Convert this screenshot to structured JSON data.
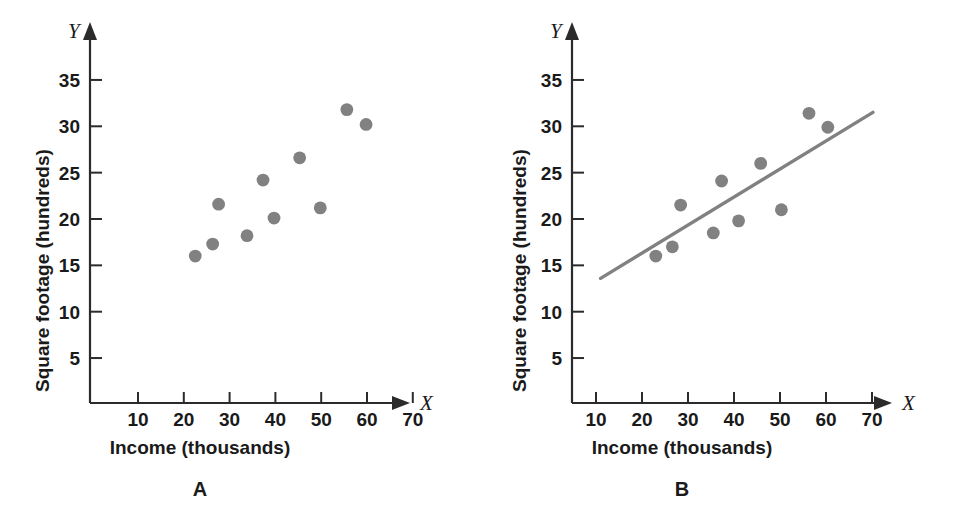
{
  "figure": {
    "panels": [
      {
        "letter": "A",
        "xlabel": "Income (thousands)",
        "ylabel": "Square footage (hundreds)",
        "x_var": "X",
        "y_var": "Y"
      },
      {
        "letter": "B",
        "xlabel": "Income (thousands)",
        "ylabel": "Square footage (hundreds)",
        "x_var": "X",
        "y_var": "Y"
      }
    ]
  },
  "colors": {
    "marker": "#818181",
    "fit_line": "#818181",
    "axis": "#2b2b2b",
    "background": "#ffffff"
  },
  "chart_data": [
    {
      "type": "scatter",
      "panel": "A",
      "title": "A",
      "xlabel": "Income (thousands)",
      "ylabel": "Square footage (hundreds)",
      "x_axis_variable": "X",
      "y_axis_variable": "Y",
      "xlim": [
        0,
        75
      ],
      "ylim": [
        0,
        38
      ],
      "xticks": [
        10,
        20,
        30,
        40,
        50,
        60,
        70
      ],
      "xtick_labels": [
        "10",
        "20",
        "30",
        "40",
        "50",
        "60",
        "70"
      ],
      "yticks": [
        5,
        10,
        15,
        20,
        25,
        30,
        35
      ],
      "ytick_labels": [
        "5",
        "10",
        "15",
        "20",
        "25",
        "30",
        "35"
      ],
      "grid": false,
      "legend": false,
      "trendline": false,
      "points": [
        {
          "x": 22.5,
          "y": 16.0
        },
        {
          "x": 26.3,
          "y": 17.3
        },
        {
          "x": 27.6,
          "y": 21.6
        },
        {
          "x": 33.8,
          "y": 18.2
        },
        {
          "x": 37.3,
          "y": 24.2
        },
        {
          "x": 39.7,
          "y": 20.1
        },
        {
          "x": 45.3,
          "y": 26.6
        },
        {
          "x": 49.8,
          "y": 21.2
        },
        {
          "x": 55.6,
          "y": 31.8
        },
        {
          "x": 59.8,
          "y": 30.2
        }
      ]
    },
    {
      "type": "scatter",
      "panel": "B",
      "title": "B",
      "xlabel": "Income (thousands)",
      "ylabel": "Square footage (hundreds)",
      "x_axis_variable": "X",
      "y_axis_variable": "Y",
      "xlim": [
        0,
        75
      ],
      "ylim": [
        0,
        38
      ],
      "xticks": [
        10,
        20,
        30,
        40,
        50,
        60,
        70
      ],
      "xtick_labels": [
        "10",
        "20",
        "30",
        "40",
        "50",
        "60",
        "70"
      ],
      "yticks": [
        5,
        10,
        15,
        20,
        25,
        30,
        35
      ],
      "ytick_labels": [
        "5",
        "10",
        "15",
        "20",
        "25",
        "30",
        "35"
      ],
      "grid": false,
      "legend": false,
      "trendline": true,
      "trendline_endpoints": [
        {
          "x": 11.0,
          "y": 13.6
        },
        {
          "x": 70.2,
          "y": 31.5
        }
      ],
      "points": [
        {
          "x": 23.0,
          "y": 16.0
        },
        {
          "x": 26.6,
          "y": 17.0
        },
        {
          "x": 28.4,
          "y": 21.5
        },
        {
          "x": 35.5,
          "y": 18.5
        },
        {
          "x": 37.3,
          "y": 24.1
        },
        {
          "x": 41.0,
          "y": 19.8
        },
        {
          "x": 45.8,
          "y": 26.0
        },
        {
          "x": 50.3,
          "y": 21.0
        },
        {
          "x": 56.3,
          "y": 31.4
        },
        {
          "x": 60.4,
          "y": 29.9
        }
      ]
    }
  ]
}
